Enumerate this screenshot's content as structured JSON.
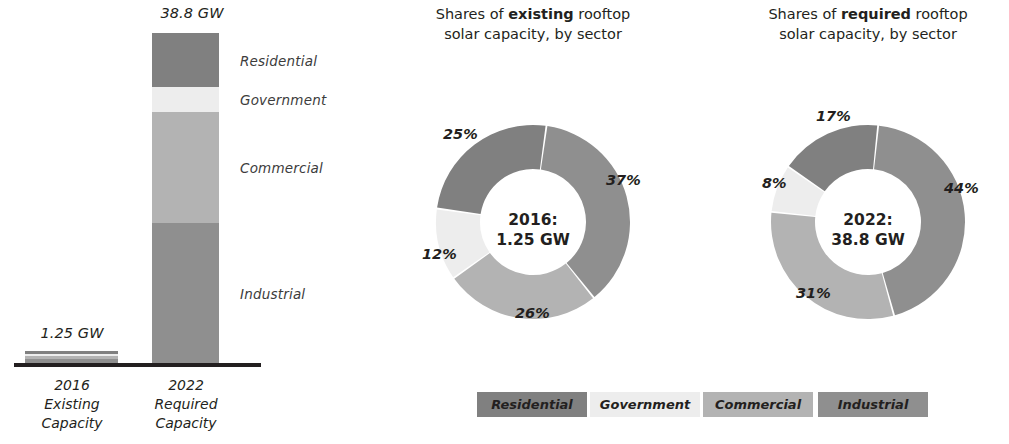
{
  "palette": {
    "residential": "#808080",
    "government": "#ededed",
    "commercial": "#b3b3b3",
    "industrial": "#8f8f8f",
    "axis": "#231f20",
    "text": "#231f20"
  },
  "bar_panel": {
    "value_labels": {
      "existing": "1.25 GW",
      "required": "38.8 GW"
    },
    "segment_labels": [
      "Residential",
      "Government",
      "Commercial",
      "Industrial"
    ],
    "categories": [
      {
        "year": "2016",
        "line2": "Existing",
        "line3": "Capacity"
      },
      {
        "year": "2022",
        "line2": "Required",
        "line3": "Capacity"
      }
    ]
  },
  "donuts": [
    {
      "title_pre": "Shares of ",
      "title_bold": "existing",
      "title_post": " rooftop",
      "title_line2": "solar capacity, by sector",
      "center_line1": "2016:",
      "center_line2": "1.25 GW",
      "labels": [
        "37%",
        "26%",
        "12%",
        "25%"
      ]
    },
    {
      "title_pre": "Shares of ",
      "title_bold": "required",
      "title_post": " rooftop",
      "title_line2": "solar capacity, by sector",
      "center_line1": "2022:",
      "center_line2": "38.8 GW",
      "labels": [
        "44%",
        "31%",
        "8%",
        "17%"
      ]
    }
  ],
  "legend": {
    "items": [
      "Residential",
      "Government",
      "Commercial",
      "Industrial"
    ]
  },
  "chart_data": [
    {
      "type": "bar",
      "title": "Existing vs required rooftop solar capacity",
      "subtype": "stacked-bar",
      "xlabel": "",
      "ylabel": "GW",
      "categories": [
        "2016 Existing Capacity",
        "2022 Required Capacity"
      ],
      "totals": [
        1.25,
        38.8
      ],
      "total_labels": [
        "1.25 GW",
        "38.8 GW"
      ],
      "ylim": [
        0,
        38.8
      ],
      "grid": false,
      "series": [
        {
          "name": "Residential",
          "values": [
            0.3125,
            6.596
          ]
        },
        {
          "name": "Government",
          "values": [
            0.15,
            3.104
          ]
        },
        {
          "name": "Commercial",
          "values": [
            0.325,
            12.028
          ]
        },
        {
          "name": "Industrial",
          "values": [
            0.4625,
            17.072
          ]
        }
      ]
    },
    {
      "type": "pie",
      "subtype": "donut",
      "title": "Shares of existing rooftop solar capacity, by sector",
      "center_label": "2016: 1.25 GW",
      "categories": [
        "Industrial",
        "Commercial",
        "Government",
        "Residential"
      ],
      "values": [
        37,
        26,
        12,
        25
      ],
      "value_labels": [
        "37%",
        "26%",
        "12%",
        "25%"
      ],
      "legend_position": "bottom"
    },
    {
      "type": "pie",
      "subtype": "donut",
      "title": "Shares of required rooftop solar capacity, by sector",
      "center_label": "2022: 38.8 GW",
      "categories": [
        "Industrial",
        "Commercial",
        "Government",
        "Residential"
      ],
      "values": [
        44,
        31,
        8,
        17
      ],
      "value_labels": [
        "44%",
        "31%",
        "8%",
        "17%"
      ],
      "legend_position": "bottom"
    }
  ]
}
